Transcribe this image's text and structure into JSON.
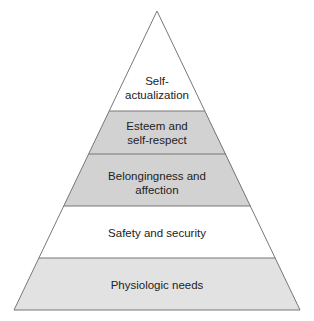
{
  "diagram": {
    "type": "pyramid",
    "levels": [
      {
        "label_line1": "Self-",
        "label_line2": "actualization",
        "fill": "#ffffff"
      },
      {
        "label_line1": "Esteem and",
        "label_line2": "self-respect",
        "fill": "#d2d2d2"
      },
      {
        "label_line1": "Belongingness and",
        "label_line2": "affection",
        "fill": "#d2d2d2"
      },
      {
        "label_line1": "Safety and security",
        "label_line2": "",
        "fill": "#ffffff"
      },
      {
        "label_line1": "Physiologic needs",
        "label_line2": "",
        "fill": "#e2e2e2"
      }
    ],
    "line_color": "#777777"
  }
}
